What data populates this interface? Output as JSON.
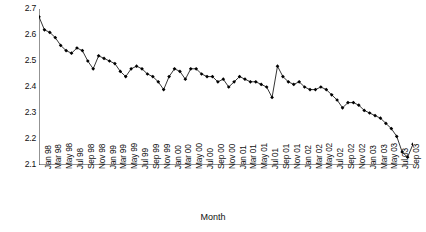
{
  "chart_data": {
    "type": "line",
    "title": "",
    "xlabel": "Month",
    "ylabel": "Total domestic circulation (millions)",
    "ylim": [
      2.1,
      2.7
    ],
    "ytick_labels": [
      "2.1",
      "2.2",
      "2.3",
      "2.4",
      "2.5",
      "2.6",
      "2.7"
    ],
    "ytick_values": [
      2.1,
      2.2,
      2.3,
      2.4,
      2.5,
      2.6,
      2.7
    ],
    "grid": false,
    "legend": "none",
    "marker": "filled-diamond",
    "line_color": "#111111",
    "marker_color": "#000000",
    "xtick_labels": [
      "Jan 98",
      "Mar 98",
      "May 98",
      "Jul 98",
      "Sep 98",
      "Nov 98",
      "Jan 99",
      "Mar 99",
      "May 99",
      "Jul 99",
      "Sep 99",
      "Nov 99",
      "Jan 00",
      "Mar 00",
      "May 00",
      "Jul 00",
      "Sep 00",
      "Nov 00",
      "Jan 01",
      "Mar 01",
      "May 01",
      "Jul 01",
      "Sep 01",
      "Nov 01",
      "Jan 02",
      "Mar 02",
      "May 02",
      "Jul 02",
      "Sep 02",
      "Nov 02",
      "Jan 03",
      "Mar 03",
      "May 03",
      "Jul 03",
      "Sep 03"
    ],
    "categories": [
      "Jan 98",
      "Feb 98",
      "Mar 98",
      "Apr 98",
      "May 98",
      "Jun 98",
      "Jul 98",
      "Aug 98",
      "Sep 98",
      "Oct 98",
      "Nov 98",
      "Dec 98",
      "Jan 99",
      "Feb 99",
      "Mar 99",
      "Apr 99",
      "May 99",
      "Jun 99",
      "Jul 99",
      "Aug 99",
      "Sep 99",
      "Oct 99",
      "Nov 99",
      "Dec 99",
      "Jan 00",
      "Feb 00",
      "Mar 00",
      "Apr 00",
      "May 00",
      "Jun 00",
      "Jul 00",
      "Aug 00",
      "Sep 00",
      "Oct 00",
      "Nov 00",
      "Dec 00",
      "Jan 01",
      "Feb 01",
      "Mar 01",
      "Apr 01",
      "May 01",
      "Jun 01",
      "Jul 01",
      "Aug 01",
      "Sep 01",
      "Oct 01",
      "Nov 01",
      "Dec 01",
      "Jan 02",
      "Feb 02",
      "Mar 02",
      "Apr 02",
      "May 02",
      "Jun 02",
      "Jul 02",
      "Aug 02",
      "Sep 02",
      "Oct 02",
      "Nov 02",
      "Dec 02",
      "Jan 03",
      "Feb 03",
      "Mar 03",
      "Apr 03",
      "May 03",
      "Jun 03",
      "Jul 03",
      "Aug 03",
      "Sep 03",
      "Oct 03"
    ],
    "values": [
      2.67,
      2.62,
      2.61,
      2.59,
      2.56,
      2.54,
      2.53,
      2.55,
      2.54,
      2.5,
      2.47,
      2.52,
      2.51,
      2.5,
      2.49,
      2.46,
      2.44,
      2.47,
      2.48,
      2.47,
      2.45,
      2.44,
      2.42,
      2.39,
      2.44,
      2.47,
      2.46,
      2.43,
      2.47,
      2.47,
      2.45,
      2.44,
      2.44,
      2.42,
      2.43,
      2.4,
      2.42,
      2.44,
      2.43,
      2.42,
      2.42,
      2.41,
      2.4,
      2.36,
      2.48,
      2.44,
      2.42,
      2.41,
      2.42,
      2.4,
      2.39,
      2.39,
      2.4,
      2.39,
      2.37,
      2.35,
      2.32,
      2.34,
      2.34,
      2.33,
      2.31,
      2.3,
      2.29,
      2.28,
      2.26,
      2.24,
      2.21,
      2.15,
      2.13,
      2.18
    ]
  }
}
